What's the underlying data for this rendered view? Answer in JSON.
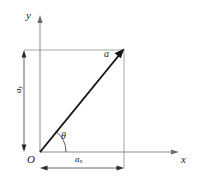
{
  "figure": {
    "kind": "vector-component-decomposition-diagram",
    "background_color": "#ffffff",
    "width": 197,
    "height": 182
  },
  "axes": {
    "x_axis": {
      "label": "x",
      "color": "#8a8a8a",
      "from": [
        40,
        152
      ],
      "to": [
        178,
        152
      ],
      "arrowhead": true
    },
    "y_axis": {
      "label": "y",
      "color": "#8a8a8a",
      "from": [
        40,
        152
      ],
      "to": [
        40,
        17
      ],
      "arrowhead": true
    },
    "origin": {
      "label": "O",
      "point": [
        40,
        152
      ]
    }
  },
  "vector": {
    "label": "a",
    "color": "#141414",
    "tail": [
      40,
      152
    ],
    "tip": [
      124,
      49
    ],
    "arrowhead": true
  },
  "angle": {
    "label": "θ",
    "name": "theta",
    "vertex": [
      40,
      152
    ],
    "between": [
      "x-axis",
      "vector-a"
    ],
    "arc_radius": 26
  },
  "components": {
    "x_component": {
      "label_base": "a",
      "label_sub": "x",
      "dimension_line_y": 168,
      "from_x": 40,
      "to_x": 124,
      "double_arrow": true
    },
    "y_component": {
      "label_base": "a",
      "label_sub": "y",
      "dimension_line_x": 24,
      "from_y": 50,
      "to_y": 152,
      "double_arrow": true,
      "rotated": true
    }
  },
  "guides": {
    "top_horizontal": {
      "y": 50,
      "from_x": 24,
      "to_x": 124,
      "color": "#9c9c9c"
    },
    "right_vertical": {
      "x": 124,
      "from_y": 50,
      "to_y": 168,
      "color": "#9c9c9c"
    }
  }
}
